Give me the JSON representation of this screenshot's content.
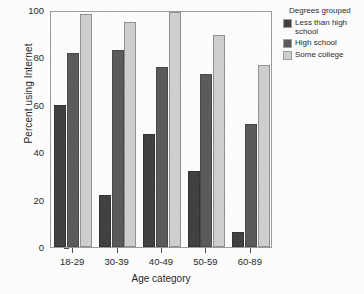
{
  "chart_data": {
    "type": "bar",
    "title": "",
    "xlabel": "Age category",
    "ylabel": "Percent using Internet",
    "categories": [
      "18-29",
      "30-39",
      "40-49",
      "50-59",
      "60-89"
    ],
    "series": [
      {
        "name": "Less than high school",
        "color": "#3b3b3b",
        "values": [
          60,
          22,
          47.5,
          32,
          6.5
        ]
      },
      {
        "name": "High school",
        "color": "#565656",
        "values": [
          82,
          83,
          76,
          73,
          52
        ]
      },
      {
        "name": "Some college",
        "color": "#cfcfcf",
        "values": [
          98.5,
          95,
          99,
          89.5,
          77
        ]
      }
    ],
    "ylim": [
      0,
      100
    ],
    "yticks": [
      0,
      20,
      40,
      60,
      80,
      100
    ],
    "ytick_labels": [
      "0",
      "20",
      "40",
      "60",
      "80",
      "100"
    ],
    "grid": false,
    "legend": {
      "title": "Degrees grouped",
      "position": "right",
      "entries": [
        "Less than high school",
        "High school",
        "Some college"
      ]
    }
  }
}
